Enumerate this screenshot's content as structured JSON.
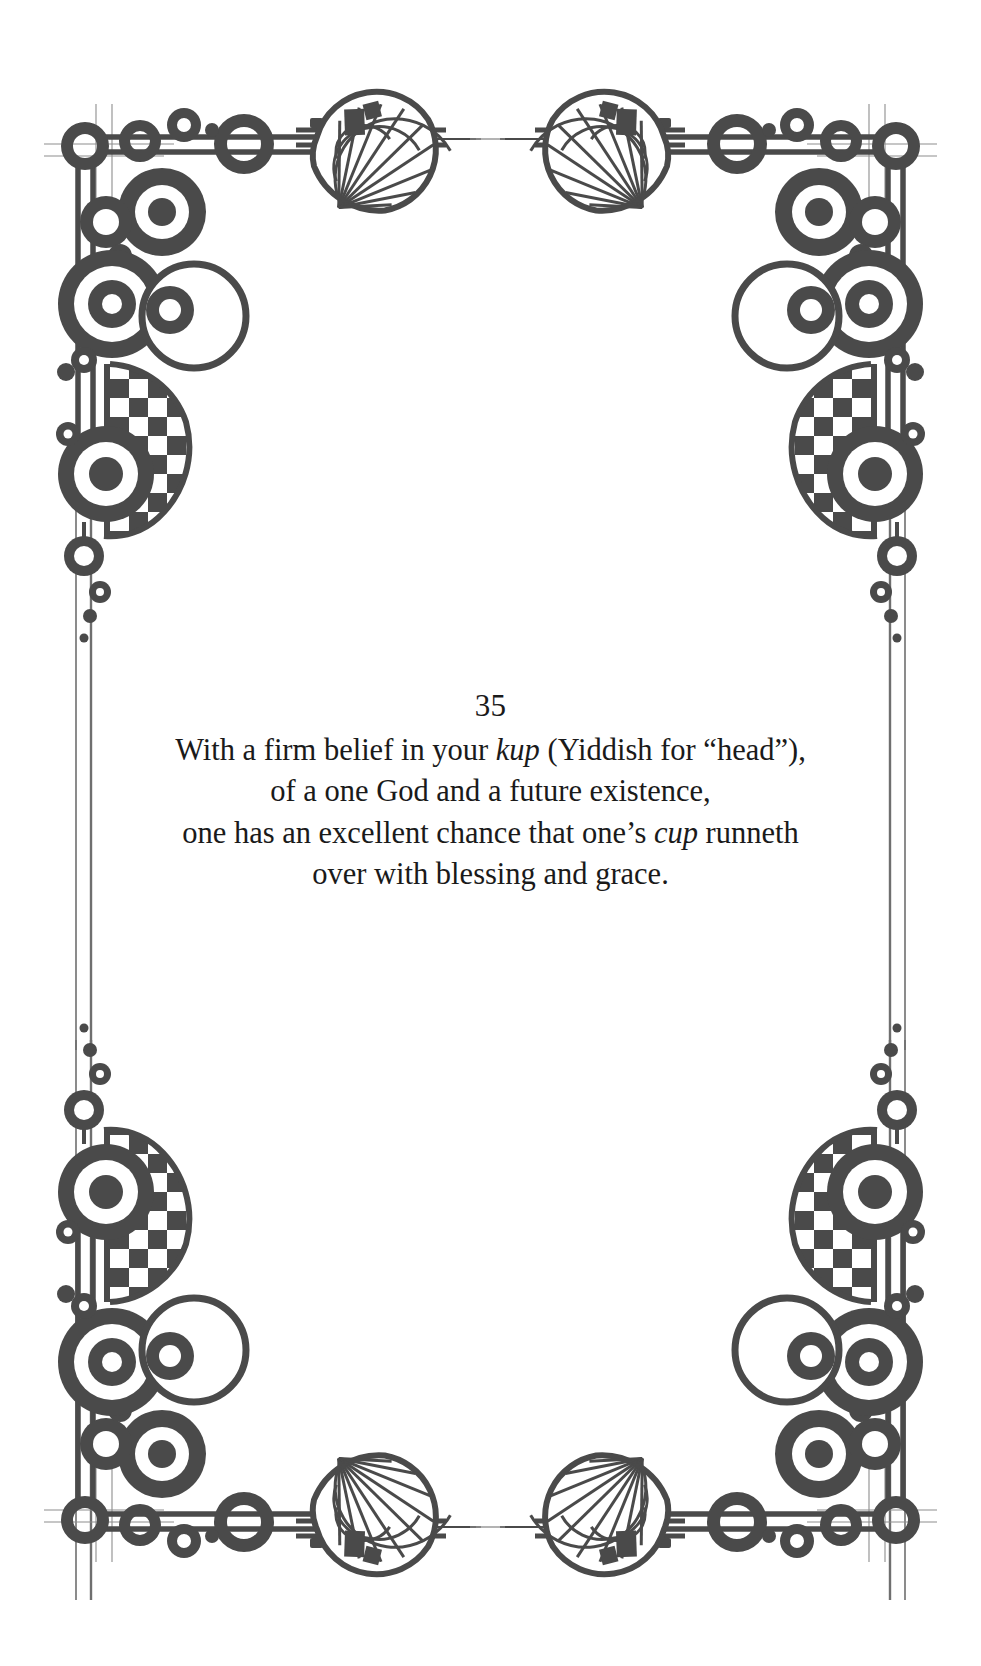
{
  "page": {
    "background_color": "#ffffff",
    "ink_color": "#4a4a4a",
    "text_color": "#1a1a1a"
  },
  "verse": {
    "number": "35",
    "lines": [
      {
        "before": "With a firm belief in your ",
        "italic": "kup",
        "after": " (Yiddish for “head”),"
      },
      {
        "before": "of a one God and a future existence,",
        "italic": "",
        "after": ""
      },
      {
        "before": "one has an excellent chance that one’s ",
        "italic": "cup",
        "after": " runneth"
      },
      {
        "before": "over with blessing and grace.",
        "italic": "",
        "after": ""
      }
    ]
  },
  "ornament": {
    "style_name": "art-nouveau-corner-frame",
    "corners": [
      "top-left",
      "top-right",
      "bottom-left",
      "bottom-right"
    ],
    "motifs": [
      "concentric-rings",
      "checkerboard-crescent",
      "fan-shell",
      "diamond-stud",
      "double-rule"
    ]
  }
}
